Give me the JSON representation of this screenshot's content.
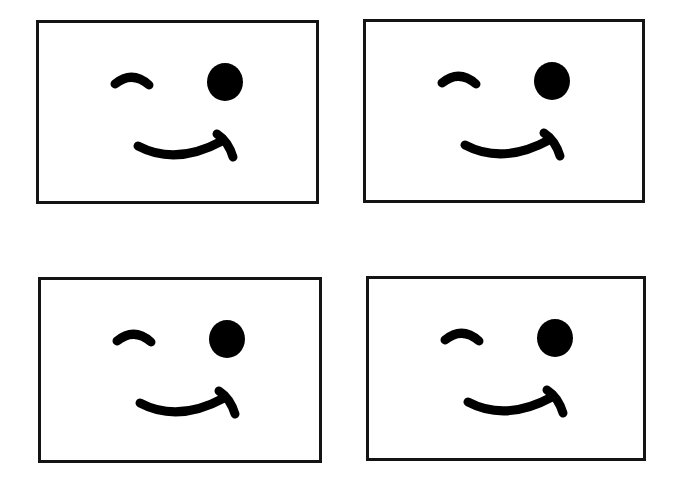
{
  "page": {
    "background": "#ffffff",
    "width": 680,
    "height": 477
  },
  "style": {
    "border_color": "#141414",
    "feature_color": "#000000"
  },
  "cards": [
    {
      "id": "card-top-left",
      "label": "Winking face",
      "x": 36,
      "y": 20,
      "w": 283,
      "h": 184,
      "features": [
        "closed-wink-eye-left",
        "open-eye-right",
        "smirk-smile-with-hook"
      ]
    },
    {
      "id": "card-top-right",
      "label": "Winking face",
      "x": 363,
      "y": 19,
      "w": 282,
      "h": 184,
      "features": [
        "closed-wink-eye-left",
        "open-eye-right",
        "smirk-smile-with-hook"
      ]
    },
    {
      "id": "card-bottom-left",
      "label": "Winking face",
      "x": 38,
      "y": 277,
      "w": 284,
      "h": 186,
      "features": [
        "closed-wink-eye-left",
        "open-eye-right",
        "smirk-smile-with-hook"
      ]
    },
    {
      "id": "card-bottom-right",
      "label": "Winking face",
      "x": 366,
      "y": 276,
      "w": 280,
      "h": 185,
      "features": [
        "closed-wink-eye-left",
        "open-eye-right",
        "smirk-smile-with-hook"
      ]
    }
  ]
}
